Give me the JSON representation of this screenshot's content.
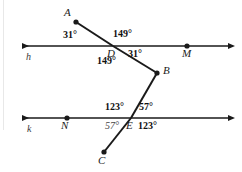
{
  "figure": {
    "type": "geometry-diagram",
    "background_color": "#ffffff",
    "stroke_color": "#1a1a1a"
  },
  "lines": [
    {
      "name": "h",
      "label": "h",
      "label_x": 26,
      "label_y": 52,
      "x1": 18,
      "y1": 46,
      "x2": 232,
      "y2": 46,
      "arrow_left": true,
      "arrow_right": true
    },
    {
      "name": "k",
      "label": "k",
      "label_x": 27,
      "label_y": 124,
      "x1": 18,
      "y1": 118,
      "x2": 232,
      "y2": 118,
      "arrow_left": true,
      "arrow_right": true
    }
  ],
  "points": [
    {
      "name": "A",
      "label": "A",
      "x": 76,
      "y": 22,
      "label_x": 64,
      "label_y": 7,
      "dot": true
    },
    {
      "name": "D",
      "label": "D",
      "x": 113,
      "y": 46,
      "label_x": 107,
      "label_y": 48,
      "dot": false
    },
    {
      "name": "M",
      "label": "M",
      "x": 187,
      "y": 46,
      "label_x": 182,
      "label_y": 48,
      "dot": true
    },
    {
      "name": "B",
      "label": "B",
      "x": 157,
      "y": 73,
      "label_x": 163,
      "label_y": 65,
      "dot": true
    },
    {
      "name": "N",
      "label": "N",
      "x": 67,
      "y": 118,
      "label_x": 61,
      "label_y": 120,
      "dot": true
    },
    {
      "name": "E",
      "label": "E",
      "x": 131,
      "y": 118,
      "label_x": 126,
      "label_y": 120,
      "dot": false
    },
    {
      "name": "C",
      "label": "C",
      "x": 104,
      "y": 152,
      "label_x": 98,
      "label_y": 155,
      "dot": true
    }
  ],
  "path_segments": [
    {
      "name": "segment-AD",
      "from": "A",
      "to": "D",
      "x1": 76,
      "y1": 22,
      "x2": 113,
      "y2": 46
    },
    {
      "name": "segment-DB",
      "from": "D",
      "to": "B",
      "x1": 113,
      "y1": 46,
      "x2": 157,
      "y2": 73
    },
    {
      "name": "segment-BE",
      "from": "B",
      "to": "E",
      "x1": 157,
      "y1": 73,
      "x2": 131,
      "y2": 118
    },
    {
      "name": "segment-EC",
      "from": "E",
      "to": "C",
      "x1": 131,
      "y1": 118,
      "x2": 104,
      "y2": 152
    }
  ],
  "angle_labels": [
    {
      "name": "angle-D-upper-left",
      "text": "31°",
      "x": 63,
      "y": 30,
      "weight": "bold"
    },
    {
      "name": "angle-D-upper-right",
      "text": "149°",
      "x": 113,
      "y": 29,
      "weight": "bold"
    },
    {
      "name": "angle-D-lower-right",
      "text": "31°",
      "x": 128,
      "y": 49,
      "weight": "bold"
    },
    {
      "name": "angle-D-lower-left",
      "text": "149°",
      "x": 97,
      "y": 56,
      "weight": "bold"
    },
    {
      "name": "angle-E-upper-left",
      "text": "123°",
      "x": 105,
      "y": 102,
      "weight": "bold"
    },
    {
      "name": "angle-E-upper-right",
      "text": "57°",
      "x": 139,
      "y": 102,
      "weight": "bold"
    },
    {
      "name": "angle-E-lower-left",
      "text": "57°",
      "x": 105,
      "y": 121,
      "weight": "light"
    },
    {
      "name": "angle-E-lower-right",
      "text": "123°",
      "x": 138,
      "y": 121,
      "weight": "bold"
    }
  ]
}
